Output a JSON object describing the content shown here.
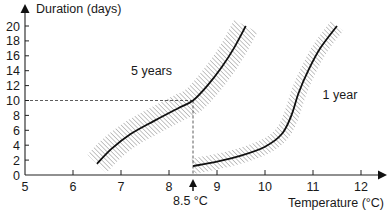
{
  "chart_data": {
    "type": "line",
    "title": "",
    "xlabel": "Temperature (°C)",
    "ylabel": "Duration (days)",
    "xlim": [
      5,
      12
    ],
    "ylim": [
      0,
      20
    ],
    "x_ticks": [
      5,
      6,
      7,
      8,
      9,
      10,
      11,
      12
    ],
    "y_ticks": [
      0,
      2,
      4,
      6,
      8,
      10,
      12,
      14,
      16,
      18,
      20
    ],
    "grid": false,
    "legend": "none (inline curve labels)",
    "series": [
      {
        "name": "5 years",
        "label_position": {
          "x": 7.5,
          "y": 14
        },
        "points": [
          [
            6.5,
            1.5
          ],
          [
            6.8,
            3.5
          ],
          [
            7.2,
            5.5
          ],
          [
            7.7,
            7.3
          ],
          [
            8.2,
            9
          ],
          [
            8.5,
            10
          ],
          [
            8.8,
            12
          ],
          [
            9.1,
            14.5
          ],
          [
            9.35,
            17
          ],
          [
            9.6,
            20
          ]
        ],
        "band_halfwidth_x": 0.5,
        "band_style": "hatched uncertainty band"
      },
      {
        "name": "1 year",
        "label_position": {
          "x": 11.2,
          "y": 10.8
        },
        "points": [
          [
            8.5,
            1.2
          ],
          [
            9.0,
            1.8
          ],
          [
            9.5,
            2.6
          ],
          [
            10.0,
            3.8
          ],
          [
            10.35,
            5.5
          ],
          [
            10.55,
            8
          ],
          [
            10.7,
            11
          ],
          [
            10.9,
            14
          ],
          [
            11.15,
            17
          ],
          [
            11.5,
            20
          ]
        ],
        "band_halfwidth_x": 0.18,
        "band_style": "hatched uncertainty band"
      }
    ],
    "annotations": [
      {
        "type": "dashed_line",
        "from": [
          5,
          10
        ],
        "to": [
          8.5,
          10
        ]
      },
      {
        "type": "dashed_line",
        "from": [
          8.5,
          10
        ],
        "to": [
          8.5,
          0
        ]
      },
      {
        "type": "arrow_marker",
        "x": 8.5,
        "text": "8.5 °C"
      }
    ]
  },
  "labels": {
    "y_axis_title": "Duration (days)",
    "x_axis_title": "Temperature (°C)",
    "series_5y": "5 years",
    "series_1y": "1 year",
    "marker": "8.5 °C"
  }
}
